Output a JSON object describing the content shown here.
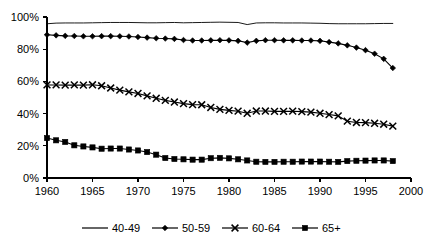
{
  "chart_data": {
    "type": "line",
    "title": "",
    "subtitle": "",
    "xlabel": "",
    "ylabel": "",
    "xlim": [
      1960,
      2000
    ],
    "ylim": [
      0,
      100
    ],
    "grid": false,
    "legend_position": "bottom",
    "x_ticks": [
      "1960",
      "1965",
      "1970",
      "1975",
      "1980",
      "1985",
      "1990",
      "1995",
      "2000"
    ],
    "x_tick_values": [
      1960,
      1965,
      1970,
      1975,
      1980,
      1985,
      1990,
      1995,
      2000
    ],
    "y_ticks": [
      "0%",
      "20%",
      "40%",
      "60%",
      "80%",
      "100%"
    ],
    "y_tick_values": [
      0,
      20,
      40,
      60,
      80,
      100
    ],
    "x": [
      1960,
      1961,
      1962,
      1963,
      1964,
      1965,
      1966,
      1967,
      1968,
      1969,
      1970,
      1971,
      1972,
      1973,
      1974,
      1975,
      1976,
      1977,
      1978,
      1979,
      1980,
      1981,
      1982,
      1983,
      1984,
      1985,
      1986,
      1987,
      1988,
      1989,
      1990,
      1991,
      1992,
      1993,
      1994,
      1995,
      1996,
      1997,
      1998
    ],
    "series": [
      {
        "name": "40-49",
        "marker": "none",
        "values": [
          95.8,
          96.2,
          96.3,
          96.3,
          96.3,
          96.4,
          96.5,
          96.6,
          96.6,
          96.6,
          96.5,
          96.4,
          96.4,
          96.5,
          96.6,
          96.4,
          96.5,
          96.6,
          96.7,
          96.8,
          96.7,
          96.6,
          95.3,
          96.3,
          96.4,
          96.4,
          96.3,
          96.3,
          96.3,
          96.2,
          96.1,
          95.9,
          95.8,
          95.8,
          95.8,
          95.8,
          95.9,
          96.0,
          96.0
        ]
      },
      {
        "name": "50-59",
        "marker": "diamond",
        "values": [
          89.0,
          88.6,
          88.3,
          88.2,
          88.0,
          88.0,
          88.1,
          88.1,
          88.0,
          87.9,
          87.6,
          87.2,
          86.8,
          86.6,
          86.4,
          85.7,
          85.4,
          85.4,
          85.5,
          85.6,
          85.5,
          85.2,
          84.1,
          85.2,
          85.6,
          85.6,
          85.5,
          85.5,
          85.4,
          85.4,
          85.2,
          84.4,
          83.6,
          82.4,
          81.0,
          79.4,
          77.2,
          74.0,
          68.3
        ]
      },
      {
        "name": "60-64",
        "marker": "cross",
        "values": [
          57.8,
          57.8,
          57.7,
          57.8,
          57.7,
          57.9,
          57.3,
          55.9,
          54.6,
          53.5,
          52.5,
          51.0,
          49.5,
          48.2,
          47.2,
          46.2,
          45.6,
          45.5,
          43.8,
          42.6,
          42.0,
          41.5,
          40.2,
          41.6,
          41.6,
          41.4,
          41.4,
          41.5,
          41.2,
          40.9,
          40.2,
          39.4,
          38.6,
          35.3,
          34.5,
          34.4,
          34.0,
          33.4,
          32.2
        ]
      },
      {
        "name": "65+",
        "marker": "square",
        "values": [
          24.8,
          23.4,
          22.4,
          20.3,
          19.6,
          19.0,
          18.2,
          18.3,
          18.3,
          17.7,
          17.1,
          16.1,
          14.5,
          12.4,
          11.8,
          11.6,
          11.4,
          11.4,
          12.3,
          12.5,
          12.2,
          11.6,
          10.9,
          10.1,
          10.0,
          10.0,
          10.1,
          10.1,
          10.2,
          10.2,
          10.2,
          10.1,
          10.0,
          10.5,
          10.7,
          10.8,
          10.9,
          10.9,
          10.5
        ]
      }
    ]
  },
  "legend": {
    "items": [
      {
        "label": "40-49"
      },
      {
        "label": "50-59"
      },
      {
        "label": "60-64"
      },
      {
        "label": "65+"
      }
    ]
  }
}
